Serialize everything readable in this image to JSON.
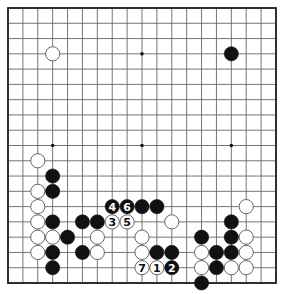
{
  "diagram": {
    "type": "go-board",
    "size": 19,
    "colors": {
      "background": "#ffffff",
      "grid_line": "#666666",
      "border": "#222222",
      "black_stone": "#111111",
      "white_stone": "#ffffff",
      "white_stone_outline": "#555555"
    },
    "star_points": [
      [
        3,
        3
      ],
      [
        9,
        3
      ],
      [
        15,
        3
      ],
      [
        3,
        9
      ],
      [
        9,
        9
      ],
      [
        15,
        9
      ],
      [
        3,
        15
      ],
      [
        9,
        15
      ],
      [
        15,
        15
      ]
    ],
    "stones": [
      {
        "col": 3,
        "row": 3,
        "color": "white",
        "label": ""
      },
      {
        "col": 15,
        "row": 3,
        "color": "black",
        "label": ""
      },
      {
        "col": 2,
        "row": 10,
        "color": "white",
        "label": ""
      },
      {
        "col": 3,
        "row": 11,
        "color": "black",
        "label": ""
      },
      {
        "col": 2,
        "row": 12,
        "color": "white",
        "label": ""
      },
      {
        "col": 3,
        "row": 12,
        "color": "black",
        "label": ""
      },
      {
        "col": 2,
        "row": 13,
        "color": "white",
        "label": ""
      },
      {
        "col": 2,
        "row": 14,
        "color": "white",
        "label": ""
      },
      {
        "col": 3,
        "row": 14,
        "color": "black",
        "label": ""
      },
      {
        "col": 5,
        "row": 14,
        "color": "black",
        "label": ""
      },
      {
        "col": 6,
        "row": 14,
        "color": "black",
        "label": ""
      },
      {
        "col": 2,
        "row": 15,
        "color": "white",
        "label": ""
      },
      {
        "col": 3,
        "row": 15,
        "color": "white",
        "label": ""
      },
      {
        "col": 4,
        "row": 15,
        "color": "black",
        "label": ""
      },
      {
        "col": 6,
        "row": 15,
        "color": "white",
        "label": ""
      },
      {
        "col": 2,
        "row": 16,
        "color": "white",
        "label": ""
      },
      {
        "col": 3,
        "row": 16,
        "color": "black",
        "label": ""
      },
      {
        "col": 5,
        "row": 16,
        "color": "black",
        "label": ""
      },
      {
        "col": 6,
        "row": 16,
        "color": "white",
        "label": ""
      },
      {
        "col": 3,
        "row": 17,
        "color": "black",
        "label": ""
      },
      {
        "col": 7,
        "row": 13,
        "color": "black",
        "label": "4"
      },
      {
        "col": 8,
        "row": 13,
        "color": "black",
        "label": "6"
      },
      {
        "col": 9,
        "row": 13,
        "color": "black",
        "label": ""
      },
      {
        "col": 10,
        "row": 13,
        "color": "black",
        "label": ""
      },
      {
        "col": 7,
        "row": 14,
        "color": "white",
        "label": "3"
      },
      {
        "col": 8,
        "row": 14,
        "color": "white",
        "label": "5"
      },
      {
        "col": 11,
        "row": 14,
        "color": "white",
        "label": ""
      },
      {
        "col": 9,
        "row": 15,
        "color": "white",
        "label": ""
      },
      {
        "col": 9,
        "row": 16,
        "color": "white",
        "label": ""
      },
      {
        "col": 10,
        "row": 16,
        "color": "black",
        "label": ""
      },
      {
        "col": 11,
        "row": 16,
        "color": "black",
        "label": ""
      },
      {
        "col": 9,
        "row": 17,
        "color": "white",
        "label": "7"
      },
      {
        "col": 10,
        "row": 17,
        "color": "white",
        "label": "1"
      },
      {
        "col": 11,
        "row": 17,
        "color": "black",
        "label": "2"
      },
      {
        "col": 16,
        "row": 13,
        "color": "white",
        "label": ""
      },
      {
        "col": 15,
        "row": 14,
        "color": "black",
        "label": ""
      },
      {
        "col": 13,
        "row": 15,
        "color": "black",
        "label": ""
      },
      {
        "col": 15,
        "row": 15,
        "color": "black",
        "label": ""
      },
      {
        "col": 16,
        "row": 15,
        "color": "white",
        "label": ""
      },
      {
        "col": 13,
        "row": 16,
        "color": "white",
        "label": ""
      },
      {
        "col": 14,
        "row": 16,
        "color": "black",
        "label": ""
      },
      {
        "col": 15,
        "row": 16,
        "color": "black",
        "label": ""
      },
      {
        "col": 16,
        "row": 16,
        "color": "white",
        "label": ""
      },
      {
        "col": 13,
        "row": 17,
        "color": "white",
        "label": ""
      },
      {
        "col": 14,
        "row": 17,
        "color": "black",
        "label": ""
      },
      {
        "col": 15,
        "row": 17,
        "color": "white",
        "label": ""
      },
      {
        "col": 16,
        "row": 17,
        "color": "white",
        "label": ""
      },
      {
        "col": 13,
        "row": 18,
        "color": "black",
        "label": ""
      }
    ]
  }
}
